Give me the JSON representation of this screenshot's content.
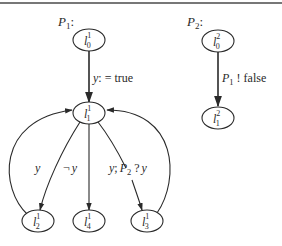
{
  "processes": [
    {
      "name": "P",
      "index": "1",
      "suffix": ":",
      "nodes": [
        {
          "id": "l0_1",
          "base": "l",
          "sup": "1",
          "sub": "0"
        },
        {
          "id": "l1_1",
          "base": "l",
          "sup": "1",
          "sub": "1"
        },
        {
          "id": "l2_1",
          "base": "l",
          "sup": "1",
          "sub": "2"
        },
        {
          "id": "l4_1",
          "base": "l",
          "sup": "1",
          "sub": "4"
        },
        {
          "id": "l3_1",
          "base": "l",
          "sup": "1",
          "sub": "3"
        }
      ],
      "edges": [
        {
          "from": "l0_1",
          "to": "l1_1",
          "label": "y: = true"
        },
        {
          "from": "l1_1",
          "to": "l2_1",
          "label": "y"
        },
        {
          "from": "l2_1",
          "to": "l1_1",
          "label": ""
        },
        {
          "from": "l1_1",
          "to": "l4_1",
          "label": "¬ y"
        },
        {
          "from": "l1_1",
          "to": "l3_1",
          "label": "y; P2 ? y"
        },
        {
          "from": "l3_1",
          "to": "l1_1",
          "label": ""
        }
      ]
    },
    {
      "name": "P",
      "index": "2",
      "suffix": ":",
      "nodes": [
        {
          "id": "l0_2",
          "base": "l",
          "sup": "2",
          "sub": "0"
        },
        {
          "id": "l1_2",
          "base": "l",
          "sup": "2",
          "sub": "1"
        }
      ],
      "edges": [
        {
          "from": "l0_2",
          "to": "l1_2",
          "label": "P1 ! false"
        }
      ]
    }
  ],
  "edge_labels": {
    "assign_y": {
      "var": "y",
      "op": ": = true"
    },
    "neg_y": {
      "neg": "¬",
      "var": "y"
    },
    "y_only": "y",
    "receive": {
      "var1": "y",
      "sep": ";",
      "proc": "P",
      "proc_idx": "2",
      "op": "?",
      "var2": "y"
    },
    "send": {
      "proc": "P",
      "proc_idx": "1",
      "op": "! false"
    }
  }
}
